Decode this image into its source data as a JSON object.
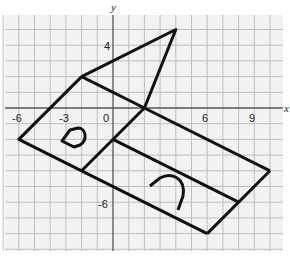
{
  "diagram": {
    "axes": {
      "x_label": "x",
      "y_label": "y"
    },
    "ticks": {
      "x": [
        {
          "value": -6,
          "label": "-6"
        },
        {
          "value": -3,
          "label": "-3"
        },
        {
          "value": 0,
          "label": "0"
        },
        {
          "value": 6,
          "label": "6"
        },
        {
          "value": 9,
          "label": "9"
        }
      ],
      "y": [
        {
          "value": 4,
          "label": "4"
        },
        {
          "value": -6,
          "label": "-6"
        }
      ]
    },
    "grid": {
      "x_range": [
        -7,
        11
      ],
      "y_range": [
        -9,
        6
      ],
      "unit": 1
    },
    "figure": {
      "description": "Paper-model net outline with triangular flap, square face, and rectangular faces",
      "vertices": {
        "tip": [
          4,
          5
        ],
        "apex": [
          -2,
          2
        ],
        "center": [
          2,
          0
        ],
        "left": [
          -6,
          -2
        ],
        "bottom_left": [
          -2,
          -4
        ],
        "inner": [
          0,
          -2
        ],
        "right": [
          10,
          -4
        ],
        "bottom": [
          6,
          -8
        ],
        "mid_right": [
          8,
          -6
        ]
      }
    },
    "colors": {
      "grid": "#b8b8b8",
      "axis": "#555555",
      "line": "#111111",
      "paper": "#f2f2f2"
    }
  }
}
